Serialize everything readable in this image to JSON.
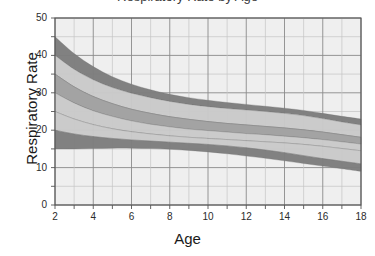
{
  "chart": {
    "title": "Respiratory Rate by Age",
    "title_cut_off": true,
    "xlabel": "Age",
    "ylabel": "Respiratory Rate",
    "yticks": [
      "0",
      "10",
      "20",
      "30",
      "40",
      "50"
    ],
    "xticks": [
      "2",
      "4",
      "6",
      "8",
      "10",
      "12",
      "14",
      "16",
      "18"
    ]
  },
  "colors": {
    "band_dark": "#7d7d7d",
    "band_medium": "#a3a3a3",
    "band_light": "#c9c9c9",
    "plot_background": "#efefef",
    "grid_major": "#8a8a8a",
    "grid_minor": "#c4c4c4",
    "axis": "#555555",
    "text": "#1a1a1a"
  },
  "chart_data": {
    "type": "area",
    "title": "Respiratory Rate by Age",
    "xlabel": "Age",
    "ylabel": "Respiratory Rate",
    "xlim": [
      2,
      18
    ],
    "ylim": [
      0,
      50
    ],
    "ytick_step": 10,
    "ygrid_step": 5,
    "xtick_step": 2,
    "xgrid_step": 1,
    "grid": true,
    "legend": "none",
    "x": [
      2,
      3,
      4,
      5,
      6,
      7,
      8,
      9,
      10,
      11,
      12,
      13,
      14,
      15,
      16,
      17,
      18
    ],
    "series": [
      {
        "name": "99th percentile band",
        "shade": "dark",
        "upper": [
          45.0,
          40.5,
          37.0,
          34.3,
          32.3,
          30.8,
          29.6,
          28.7,
          28.0,
          27.4,
          26.9,
          26.4,
          25.9,
          25.3,
          24.5,
          23.7,
          23.0
        ],
        "lower": [
          40.0,
          36.3,
          33.5,
          31.4,
          29.9,
          28.7,
          27.7,
          26.9,
          26.3,
          25.8,
          25.4,
          25.0,
          24.5,
          23.9,
          23.1,
          22.2,
          21.4
        ]
      },
      {
        "name": "90th percentile band",
        "shade": "light",
        "upper": [
          40.0,
          36.3,
          33.5,
          31.4,
          29.9,
          28.7,
          27.7,
          26.9,
          26.3,
          25.8,
          25.4,
          25.0,
          24.5,
          23.9,
          23.1,
          22.2,
          21.4
        ],
        "lower": [
          35.0,
          31.6,
          29.0,
          27.1,
          25.6,
          24.5,
          23.6,
          22.9,
          22.3,
          21.8,
          21.4,
          21.0,
          20.6,
          20.1,
          19.5,
          18.8,
          18.1
        ]
      },
      {
        "name": "75th percentile band",
        "shade": "medium",
        "upper": [
          35.0,
          31.6,
          29.0,
          27.1,
          25.6,
          24.5,
          23.6,
          22.9,
          22.3,
          21.8,
          21.4,
          21.0,
          20.6,
          20.1,
          19.5,
          18.8,
          18.1
        ]
      },
      {
        "name": "50th percentile band",
        "shade": "medium",
        "lower": [
          30.0,
          27.3,
          25.2,
          23.7,
          22.5,
          21.6,
          20.9,
          20.3,
          19.9,
          19.5,
          19.1,
          18.8,
          18.4,
          18.0,
          17.5,
          16.9,
          16.3
        ]
      },
      {
        "name": "25th percentile band",
        "shade": "light",
        "upper": [
          30.0,
          27.3,
          25.2,
          23.7,
          22.5,
          21.6,
          20.9,
          20.3,
          19.9,
          19.5,
          19.1,
          18.8,
          18.4,
          18.0,
          17.5,
          16.9,
          16.3
        ],
        "lower": [
          25.0,
          23.0,
          21.5,
          20.4,
          19.6,
          19.0,
          18.5,
          18.1,
          17.8,
          17.5,
          17.2,
          16.9,
          16.6,
          16.2,
          15.7,
          15.1,
          14.5
        ]
      },
      {
        "name": "10th percentile band",
        "shade": "light",
        "upper": [
          25.0,
          23.0,
          21.5,
          20.4,
          19.6,
          19.0,
          18.5,
          18.1,
          17.8,
          17.5,
          17.2,
          16.9,
          16.6,
          16.2,
          15.7,
          15.1,
          14.5
        ]
      },
      {
        "name": "1st percentile band",
        "shade": "dark",
        "upper": [
          20.0,
          19.0,
          18.3,
          17.8,
          17.4,
          17.1,
          16.8,
          16.5,
          16.2,
          15.8,
          15.3,
          14.7,
          14.0,
          13.2,
          12.4,
          11.7,
          11.0
        ],
        "lower": [
          15.0,
          15.0,
          15.1,
          15.2,
          15.2,
          15.1,
          14.9,
          14.6,
          14.2,
          13.7,
          13.1,
          12.5,
          11.8,
          11.1,
          10.4,
          9.7,
          9.0
        ]
      }
    ]
  }
}
